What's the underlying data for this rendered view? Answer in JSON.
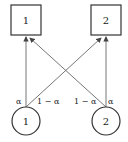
{
  "diagram": {
    "top_nodes": [
      {
        "label": "1",
        "shape": "square"
      },
      {
        "label": "2",
        "shape": "square"
      }
    ],
    "bottom_nodes": [
      {
        "label": "1",
        "shape": "circle"
      },
      {
        "label": "2",
        "shape": "circle"
      }
    ],
    "edges": [
      {
        "from": "circle-1",
        "to": "square-1",
        "label": "α"
      },
      {
        "from": "circle-1",
        "to": "square-2",
        "label": "1 − α"
      },
      {
        "from": "circle-2",
        "to": "square-1",
        "label": "1 − α"
      },
      {
        "from": "circle-2",
        "to": "square-2",
        "label": "α"
      }
    ],
    "colors": {
      "stroke": "#333333",
      "edge": "#555555",
      "background": "#ffffff"
    }
  }
}
